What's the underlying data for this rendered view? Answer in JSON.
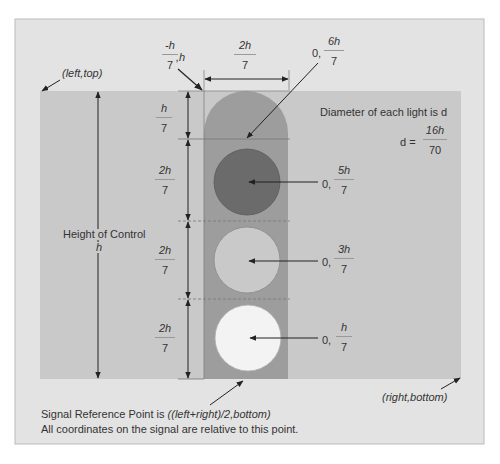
{
  "diagram": {
    "corners": {
      "top_left": "(left,top)",
      "bottom_right": "(right,bottom)"
    },
    "height_label": {
      "line1": "Height of Control",
      "line2": "h"
    },
    "top_corner_coord": {
      "num": "-h",
      "den": "7",
      "suffix": ",h"
    },
    "width_dim": {
      "num": "2h",
      "den": "7"
    },
    "segments": [
      {
        "num": "h",
        "den": "7"
      },
      {
        "num": "2h",
        "den": "7"
      },
      {
        "num": "2h",
        "den": "7"
      },
      {
        "num": "2h",
        "den": "7"
      }
    ],
    "points": [
      {
        "prefix": "0,",
        "num": "6h",
        "den": "7",
        "target": "arc-center"
      },
      {
        "prefix": "0,",
        "num": "5h",
        "den": "7",
        "target": "top-light"
      },
      {
        "prefix": "0,",
        "num": "3h",
        "den": "7",
        "target": "middle-light"
      },
      {
        "prefix": "0,",
        "num": "h",
        "den": "7",
        "target": "bottom-light"
      }
    ],
    "diameter_note": {
      "text": "Diameter of each light is d",
      "eq_prefix": "d =",
      "num": "16h",
      "den": "70"
    },
    "reference_note": {
      "line1_prefix": "Signal Reference Point is ",
      "line1_italic": "((left+right)/2,bottom)",
      "line2": "All coordinates on the signal are relative to this point."
    },
    "colors": {
      "outer_panel": "#e3e3e3",
      "control_area": "#c9c9c9",
      "housing": "#9d9d9d",
      "light_top": "#6b6b6b",
      "light_middle": "#c9c9c9",
      "light_bottom": "#f3f3f3",
      "line": "#333333"
    }
  }
}
